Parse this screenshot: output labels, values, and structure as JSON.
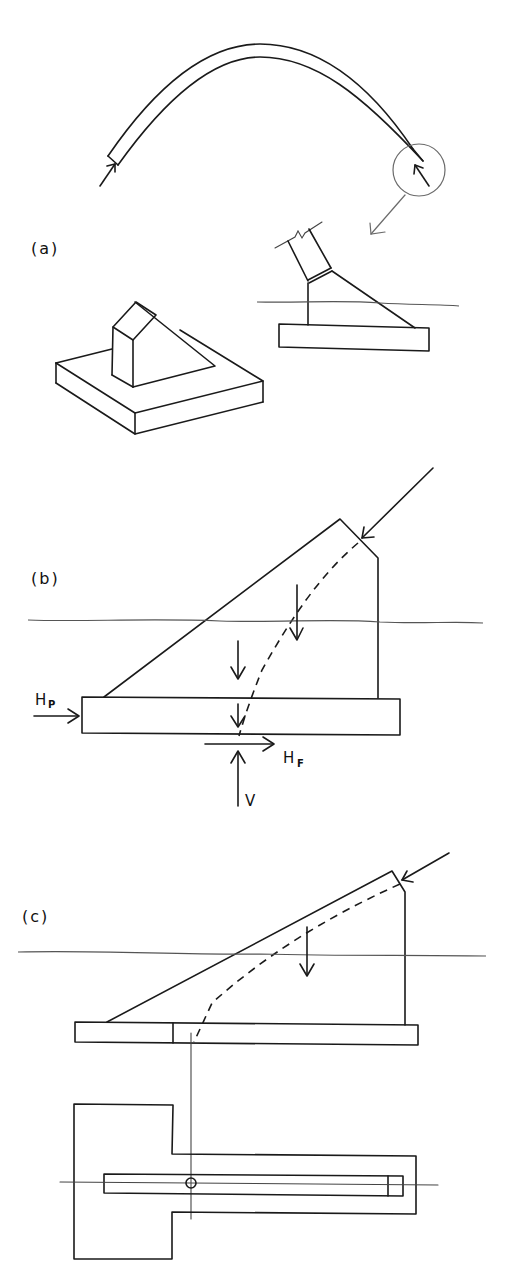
{
  "figure": {
    "panels": [
      {
        "id": "a",
        "label": "(a)",
        "description": "Arch with thrust at supports; detail of abutment footing shown in elevation and isometric view"
      },
      {
        "id": "b",
        "label": "(b)",
        "description": "Abutment elevation with inclined thrust, self-weight loads, passive and friction resistance",
        "forces": {
          "passive": {
            "symbol": "H",
            "subscript": "P"
          },
          "friction": {
            "symbol": "H",
            "subscript": "F"
          },
          "vertical": {
            "symbol": "V"
          }
        }
      },
      {
        "id": "c",
        "label": "(c)",
        "description": "Abutment elevation with extended footing and plan view showing resultant location"
      }
    ]
  },
  "colors": {
    "line": "#1a1a1a",
    "grade_line": "#555555",
    "background": "#ffffff"
  }
}
